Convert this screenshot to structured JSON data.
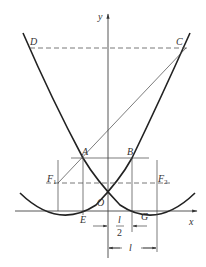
{
  "figure": {
    "type": "geometry-diagram",
    "axes": {
      "x_label": "x",
      "y_label": "y",
      "origin_label": "O"
    },
    "points": {
      "A": "A",
      "B": "B",
      "C": "C",
      "D": "D",
      "E": "E",
      "G": "G",
      "F1": "F",
      "F1_sub": "1",
      "F2": "F",
      "F2_sub": "2"
    },
    "dimensions": {
      "half": {
        "numerator": "l",
        "denominator": "2"
      },
      "full": "l"
    },
    "colors": {
      "curve": "#222222",
      "line": "#333333",
      "text": "#333333",
      "background": "#ffffff"
    }
  }
}
